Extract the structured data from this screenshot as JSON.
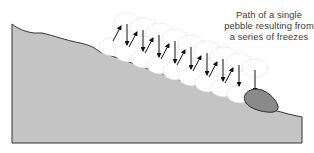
{
  "caption": {
    "lines": [
      "Path of a single",
      "pebble resulting from",
      "a series of freezes"
    ]
  },
  "colors": {
    "ground": "#c4c4c4",
    "ground_outline": "#333333",
    "pebble_fill": "#8a8a8a",
    "pebble_outline": "#2a2a2a",
    "ghost_outline": "#d8d8d8",
    "arrow": "#111111",
    "text": "#3a3a3a"
  }
}
